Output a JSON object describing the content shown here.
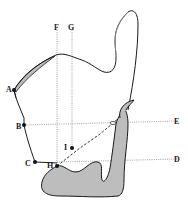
{
  "diagram": {
    "title": "",
    "colors": {
      "background": "#ffffff",
      "outline": "#1a1a1a",
      "fill_gray": "#bdbdbd",
      "dotted_line": "#888888"
    },
    "points": {
      "A": {
        "label": "A",
        "x": 14,
        "y": 90
      },
      "B": {
        "label": "B",
        "x": 24,
        "y": 125
      },
      "C": {
        "label": "C",
        "x": 35,
        "y": 162
      },
      "H": {
        "label": "H",
        "x": 57,
        "y": 166
      },
      "I": {
        "label": "I",
        "x": 72,
        "y": 148
      }
    },
    "lines": {
      "F": {
        "label": "F",
        "orientation": "vertical"
      },
      "G": {
        "label": "G",
        "orientation": "vertical"
      },
      "E": {
        "label": "E",
        "orientation": "horizontal"
      },
      "D": {
        "label": "D",
        "orientation": "horizontal"
      }
    }
  }
}
